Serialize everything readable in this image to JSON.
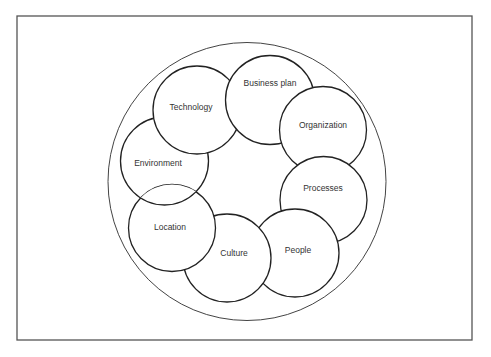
{
  "diagram": {
    "type": "ring-of-overlapping-circles",
    "colors": {
      "stroke": "#222222",
      "fill": "#ffffff",
      "text": "#333333",
      "frame": "#555555"
    },
    "nodes": [
      {
        "id": "business-plan",
        "label": "Business plan"
      },
      {
        "id": "organization",
        "label": "Organization"
      },
      {
        "id": "processes",
        "label": "Processes"
      },
      {
        "id": "people",
        "label": "People"
      },
      {
        "id": "culture",
        "label": "Culture"
      },
      {
        "id": "location",
        "label": "Location"
      },
      {
        "id": "environment",
        "label": "Environment"
      },
      {
        "id": "technology",
        "label": "Technology"
      }
    ]
  }
}
